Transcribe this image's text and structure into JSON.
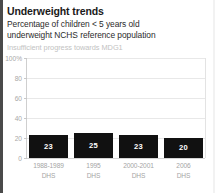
{
  "header": {
    "title": "Underweight trends",
    "subtitle_line1": "Percentage of children < 5 years old",
    "subtitle_line2": "underweight NCHS reference population",
    "note": "Insufficient progress towards MDG1"
  },
  "colors": {
    "bar": "#111111",
    "bar_label": "#ffffff",
    "grid": "#e8e8e8",
    "axis_label": "#a5a5a5",
    "title": "#1a1a1a",
    "note": "#c2c2c2",
    "background": "#ffffff"
  },
  "chart_data": {
    "type": "bar",
    "title": "Underweight trends",
    "subtitle": "Percentage of children < 5 years old underweight NCHS reference population",
    "annotation": "Insufficient progress towards MDG1",
    "xlabel": "",
    "ylabel": "",
    "ylim": [
      0,
      100
    ],
    "grid": true,
    "legend": "none",
    "categories": [
      "1988-1989",
      "1995",
      "2000-2001",
      "2006"
    ],
    "category_sublabels": [
      "DHS",
      "DHS",
      "DHS",
      "DHS"
    ],
    "values": [
      23,
      25,
      23,
      20
    ],
    "value_labels": [
      "23",
      "25",
      "23",
      "20"
    ],
    "yticks": [
      0,
      20,
      40,
      60,
      80,
      100
    ],
    "ytick_labels": [
      "0",
      "20",
      "40",
      "60",
      "80",
      "100%"
    ]
  }
}
